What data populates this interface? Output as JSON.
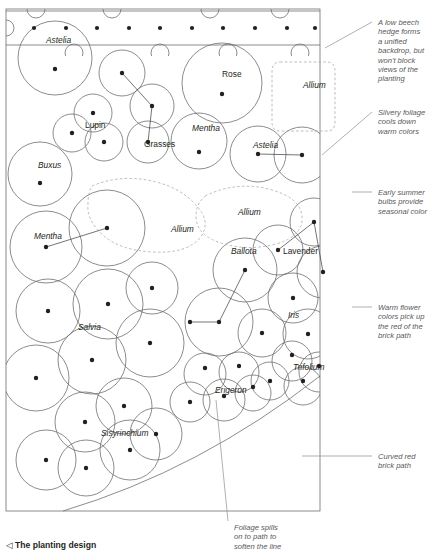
{
  "figure": {
    "caption": "The planting design",
    "caption_marker": "◁"
  },
  "plan": {
    "hedge_band": {
      "name": "low beech hedge",
      "dot_count": 10
    },
    "beds": [
      {
        "name": "Astelia",
        "style": "italic",
        "label_x": 46,
        "label_y": 43
      },
      {
        "name": "Rose",
        "style": "upright",
        "label_x": 222,
        "label_y": 77
      },
      {
        "name": "Allium",
        "style": "italic",
        "label_x": 303,
        "label_y": 88
      },
      {
        "name": "Lupin",
        "style": "upright",
        "label_x": 85,
        "label_y": 128
      },
      {
        "name": "Grasses",
        "style": "upright",
        "label_x": 144,
        "label_y": 147
      },
      {
        "name": "Mentha",
        "style": "italic",
        "label_x": 192,
        "label_y": 131
      },
      {
        "name": "Astelia",
        "style": "italic",
        "label_x": 253,
        "label_y": 148
      },
      {
        "name": "Buxus",
        "style": "italic",
        "label_x": 38,
        "label_y": 168
      },
      {
        "name": "Allium",
        "style": "italic",
        "label_x": 171,
        "label_y": 232
      },
      {
        "name": "Allium",
        "style": "italic",
        "label_x": 238,
        "label_y": 215
      },
      {
        "name": "Mentha",
        "style": "italic",
        "label_x": 34,
        "label_y": 239
      },
      {
        "name": "Lavender",
        "style": "upright",
        "label_x": 283,
        "label_y": 254
      },
      {
        "name": "Ballota",
        "style": "italic",
        "label_x": 231,
        "label_y": 254
      },
      {
        "name": "Salvia",
        "style": "italic",
        "label_x": 78,
        "label_y": 330
      },
      {
        "name": "Iris",
        "style": "italic",
        "label_x": 288,
        "label_y": 318
      },
      {
        "name": "Trifolium",
        "style": "italic",
        "label_x": 293,
        "label_y": 370
      },
      {
        "name": "Erigeron",
        "style": "italic",
        "label_x": 215,
        "label_y": 393
      },
      {
        "name": "Sisyrinchium",
        "style": "italic",
        "label_x": 101,
        "label_y": 436
      }
    ],
    "path": {
      "name": "curved red brick path"
    }
  },
  "annotations": [
    {
      "id": "hedge-note",
      "lines": [
        "A low beech",
        "hedge forms",
        "a unified",
        "backdrop, but",
        "won't block",
        "views of the",
        "planting"
      ],
      "x": 378,
      "y": 18,
      "leader": {
        "x1": 325,
        "y1": 48,
        "x2": 372,
        "y2": 22
      }
    },
    {
      "id": "foliage-note",
      "lines": [
        "Silvery foliage",
        "cools down",
        "warm colors"
      ],
      "x": 378,
      "y": 108,
      "leader": {
        "x1": 322,
        "y1": 155,
        "x2": 372,
        "y2": 112
      }
    },
    {
      "id": "bulbs-note",
      "lines": [
        "Early summer",
        "bulbs provide",
        "seasonal color"
      ],
      "x": 378,
      "y": 188,
      "leader": {
        "x1": 352,
        "y1": 192,
        "x2": 372,
        "y2": 192
      }
    },
    {
      "id": "warm-note",
      "lines": [
        "Warm flower",
        "colors pick up",
        "the red of the",
        "brick path"
      ],
      "x": 378,
      "y": 303,
      "leader": {
        "x1": 352,
        "y1": 307,
        "x2": 372,
        "y2": 307
      }
    },
    {
      "id": "brick-note",
      "lines": [
        "Curved red",
        "brick path"
      ],
      "x": 378,
      "y": 452,
      "leader": {
        "x1": 302,
        "y1": 456,
        "x2": 372,
        "y2": 456
      }
    },
    {
      "id": "spills-note",
      "lines": [
        "Foliage spills",
        "on to path to",
        "soften the line"
      ],
      "x": 234,
      "y": 523,
      "leader": {
        "x1": 216,
        "y1": 400,
        "x2": 228,
        "y2": 521
      }
    }
  ],
  "colors": {
    "outline": "#6d6e71",
    "dashed_outline": "#aaabad",
    "dot": "#231f20",
    "text": "#231f20",
    "annotation_text": "#6d6e71",
    "border": "#808285",
    "background": "#ffffff"
  }
}
